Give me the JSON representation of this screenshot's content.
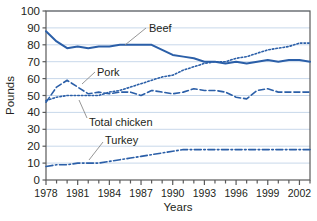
{
  "chart_data": {
    "type": "line",
    "title": "",
    "xlabel": "Years",
    "ylabel": "Pounds",
    "xlim": [
      1978,
      2003
    ],
    "ylim": [
      0,
      100
    ],
    "ytick_step": 10,
    "grid": true,
    "grid_color": "#c8d8ea",
    "frame_color": "#5a5a5a",
    "series_color": "#2b5fa8",
    "legend_position": "inline-annotations",
    "x": [
      1978,
      1979,
      1980,
      1981,
      1982,
      1983,
      1984,
      1985,
      1986,
      1987,
      1988,
      1989,
      1990,
      1991,
      1992,
      1993,
      1994,
      1995,
      1996,
      1997,
      1998,
      1999,
      2000,
      2001,
      2002,
      2003
    ],
    "yticks": [
      0,
      10,
      20,
      30,
      40,
      50,
      60,
      70,
      80,
      90,
      100
    ],
    "xticks": [
      1978,
      1979,
      1980,
      1981,
      1982,
      1983,
      1984,
      1985,
      1986,
      1987,
      1988,
      1989,
      1990,
      1991,
      1992,
      1993,
      1994,
      1995,
      1996,
      1997,
      1998,
      1999,
      2000,
      2001,
      2002,
      2003
    ],
    "xtick_labels": [
      "1978",
      "",
      "",
      "1981",
      "",
      "",
      "1984",
      "",
      "",
      "1987",
      "",
      "",
      "1990",
      "",
      "",
      "1993",
      "",
      "",
      "1996",
      "",
      "",
      "1999",
      "",
      "",
      "2002",
      ""
    ],
    "series": [
      {
        "name": "Beef",
        "label": "Beef",
        "dash": "solid",
        "values": [
          88,
          82,
          78,
          79,
          78,
          79,
          79,
          80,
          80,
          80,
          80,
          77,
          74,
          73,
          72,
          70,
          70,
          69,
          70,
          69,
          70,
          71,
          70,
          71,
          71,
          70
        ]
      },
      {
        "name": "Pork",
        "label": "Pork",
        "dash": "dashed",
        "values": [
          46,
          55,
          59,
          55,
          51,
          52,
          51,
          52,
          52,
          50,
          53,
          52,
          51,
          52,
          54,
          53,
          53,
          52,
          49,
          48,
          53,
          54,
          52,
          52,
          52,
          52
        ]
      },
      {
        "name": "Total chicken",
        "label": "Total chicken",
        "dash": "dotted",
        "values": [
          47,
          49,
          50,
          50,
          50,
          50,
          52,
          53,
          55,
          57,
          59,
          61,
          62,
          65,
          67,
          69,
          70,
          70,
          72,
          73,
          75,
          77,
          78,
          79,
          81,
          81
        ]
      },
      {
        "name": "Turkey",
        "label": "Turkey",
        "dash": "dashdot",
        "values": [
          8,
          9,
          9,
          10,
          10,
          10,
          11,
          12,
          13,
          14,
          15,
          16,
          17,
          18,
          18,
          18,
          18,
          18,
          18,
          18,
          18,
          18,
          18,
          18,
          18,
          18
        ]
      }
    ],
    "annotations": [
      {
        "text": "Beef",
        "label_x": 149,
        "label_y": 28,
        "leader": [
          [
            146,
            28
          ],
          [
            125,
            45
          ]
        ]
      },
      {
        "text": "Pork",
        "label_x": 97,
        "label_y": 72,
        "leader": [
          [
            95,
            72
          ],
          [
            82,
            84
          ]
        ]
      },
      {
        "text": "Total chicken",
        "label_x": 89,
        "label_y": 122,
        "leader": [
          [
            87,
            118
          ],
          [
            79,
            100
          ]
        ]
      },
      {
        "text": "Turkey",
        "label_x": 105,
        "label_y": 140,
        "leader": [
          [
            103,
            142
          ],
          [
            89,
            160
          ]
        ]
      }
    ]
  }
}
